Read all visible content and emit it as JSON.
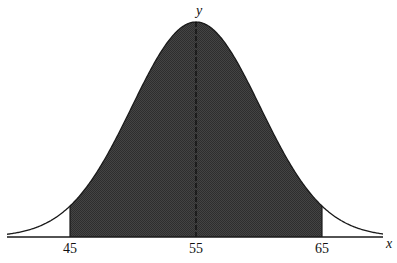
{
  "figure": {
    "type": "normal-distribution-curve",
    "axis_labels": {
      "x": "x",
      "y": "y"
    },
    "tick_labels": [
      "45",
      "55",
      "65"
    ],
    "mean": 55,
    "shaded_interval": {
      "from": 45,
      "to": 65
    },
    "colors": {
      "fill": "#3c3c3c",
      "curve": "#1a1a1a",
      "axis": "#1a1a1a",
      "background": "#ffffff"
    }
  },
  "layout": {
    "axis_y": 237,
    "axis_x_start": 7,
    "axis_x_end": 383,
    "mean_px": 196,
    "px_per_unit": 12.6,
    "peak_height_px": 215,
    "sigma_px": 64,
    "tick_label_y": 253,
    "y_label": {
      "x": 199,
      "y": 15
    },
    "x_label": {
      "x": 386,
      "y": 248
    }
  }
}
